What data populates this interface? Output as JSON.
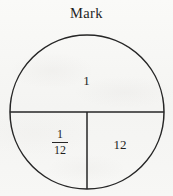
{
  "figure": {
    "title": "Mark",
    "shape": "circle",
    "stroke_color": "#262626",
    "background_color": "#f6f6f4",
    "text_color": "#1f1f1f",
    "geometry": {
      "center_x": 87,
      "center_y": 112,
      "radius": 77,
      "stroke_width": 1.5,
      "horizontal_diameter_y": 112,
      "vertical_radius_x": 87,
      "vertical_radius_from_y": 112,
      "vertical_radius_to_y": 189
    },
    "regions": [
      {
        "name": "top-half",
        "label": "1",
        "label_x": 87,
        "label_y": 82
      },
      {
        "name": "bottom-left-quarter",
        "label": "1/12",
        "numerator": "1",
        "denominator": "12",
        "label_x": 60,
        "label_y": 144
      },
      {
        "name": "bottom-right-quarter",
        "label": "12",
        "label_x": 120,
        "label_y": 145
      }
    ]
  }
}
